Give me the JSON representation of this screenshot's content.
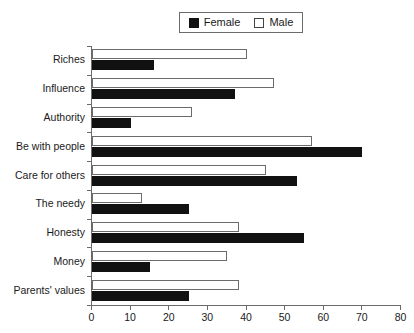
{
  "legend": {
    "entries": [
      {
        "label": "Female",
        "swatch": "filled-black-square",
        "color": "#111111"
      },
      {
        "label": "Male",
        "swatch": "open-white-square",
        "color": "#ffffff"
      }
    ]
  },
  "chart_data": {
    "type": "bar",
    "orientation": "horizontal",
    "title": "",
    "xlabel": "",
    "ylabel": "",
    "xlim": [
      0,
      80
    ],
    "xticks": [
      0,
      10,
      20,
      30,
      40,
      50,
      60,
      70,
      80
    ],
    "grid": false,
    "legend_position": "top-center",
    "categories": [
      "Riches",
      "Influence",
      "Authority",
      "Be with people",
      "Care for others",
      "The needy",
      "Honesty",
      "Money",
      "Parents' values"
    ],
    "series": [
      {
        "name": "Female",
        "color": "#111111",
        "values": [
          16,
          37,
          10,
          70,
          53,
          25,
          55,
          15,
          25
        ]
      },
      {
        "name": "Male",
        "color": "#ffffff",
        "values": [
          40,
          47,
          26,
          57,
          45,
          13,
          38,
          35,
          38
        ]
      }
    ]
  }
}
